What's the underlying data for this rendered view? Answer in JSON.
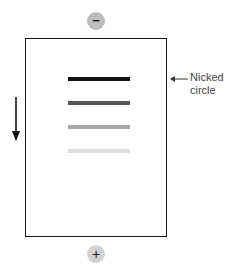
{
  "electrodes": {
    "negative": {
      "symbol": "−",
      "color": "#bdbdbd"
    },
    "positive": {
      "symbol": "+",
      "color": "#d2d2d2"
    }
  },
  "bands": [
    {
      "name": "nicked-circle",
      "top": 77,
      "color": "#111111"
    },
    {
      "name": "band-2",
      "top": 101,
      "color": "#555555"
    },
    {
      "name": "band-3",
      "top": 125,
      "color": "#a8a8a8"
    },
    {
      "name": "band-4",
      "top": 149,
      "color": "#dedede"
    }
  ],
  "annotation": {
    "line1": "Nicked",
    "line2": "circle"
  },
  "migration_arrow": {
    "direction": "down"
  }
}
